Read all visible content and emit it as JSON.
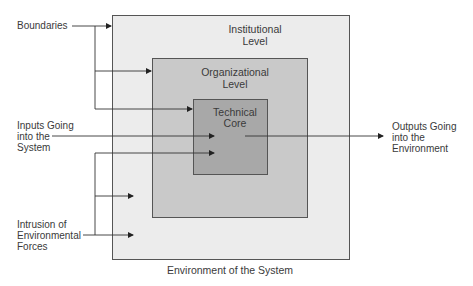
{
  "diagram": {
    "boxes": {
      "institutional": {
        "label_line1": "Institutional",
        "label_line2": "Level",
        "fill": "#ececec"
      },
      "organizational": {
        "label_line1": "Organizational",
        "label_line2": "Level",
        "fill": "#c9c9c9"
      },
      "technical_core": {
        "label_line1": "Technical",
        "label_line2": "Core",
        "fill": "#a8a8a8"
      }
    },
    "labels": {
      "boundaries": "Boundaries",
      "inputs": [
        "Inputs Going",
        "into the",
        "System"
      ],
      "outputs": [
        "Outputs Going",
        "into the",
        "Environment"
      ],
      "intrusion": [
        "Intrusion of",
        "Environmental",
        "Forces"
      ],
      "environment": "Environment of the System"
    },
    "colors": {
      "line": "#333333",
      "text": "#3a3a3a"
    }
  }
}
